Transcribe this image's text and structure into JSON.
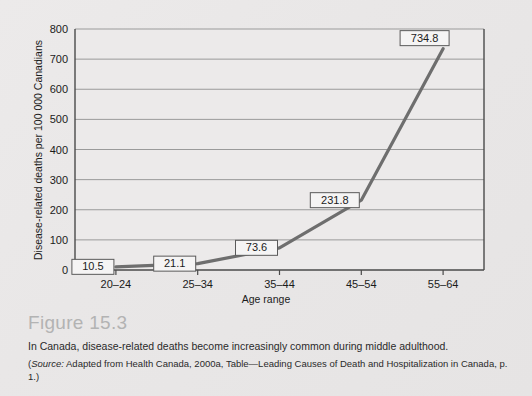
{
  "figure": {
    "number_label": "Figure 15.3",
    "caption": "In Canada, disease-related deaths become increasingly common during middle adulthood.",
    "source_prefix": "(",
    "source_word": "Source:",
    "source_rest": " Adapted from Health Canada, 2000a, Table—Leading Causes of Death and Hospitalization in Canada, p. 1.)"
  },
  "chart_data": {
    "type": "line",
    "title": "",
    "xlabel": "Age range",
    "ylabel": "Disease-related deaths per 100 000 Canadians",
    "categories": [
      "20–24",
      "25–34",
      "35–44",
      "45–54",
      "55–64"
    ],
    "values": [
      10.5,
      21.1,
      73.6,
      231.8,
      734.8
    ],
    "point_labels": [
      "10.5",
      "21.1",
      "73.6",
      "231.8",
      "734.8"
    ],
    "ylim": [
      0,
      800
    ],
    "yticks": [
      0,
      100,
      200,
      300,
      400,
      500,
      600,
      700,
      800
    ],
    "ytick_labels": [
      "0",
      "100",
      "200",
      "300",
      "400",
      "500",
      "600",
      "700",
      "800"
    ],
    "grid": "horizontal",
    "legend": "none",
    "series_color": "#6e6e6e",
    "grid_color": "#9a9a9a",
    "axis_color": "#4a4a4a",
    "plot_background": "#eceaea",
    "label_box_fill": "#f5f4f4",
    "label_box_stroke": "#5a5a5a"
  }
}
